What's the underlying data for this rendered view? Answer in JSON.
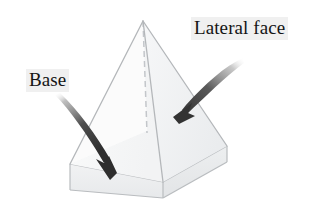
{
  "figure": {
    "shape_name": "square-pyramid-with-base-slab",
    "background_color": "#ffffff",
    "line_color": "#b9bcbf",
    "hidden_line_color": "#c9ccd0",
    "face_fill_light": "#f6f7f8",
    "face_fill_shaded": "#eceeef",
    "base_slab_fill": "#e6e8ea",
    "arrow_color": "#3b3b3b",
    "label_background": "#f0f0f0",
    "label_text_color": "#151515"
  },
  "labels": [
    {
      "id": "lateral-face",
      "text": "Lateral face",
      "x": 191,
      "y": 17
    },
    {
      "id": "base",
      "text": "Base",
      "x": 26,
      "y": 69
    }
  ],
  "annotations": {
    "lateral_face_arrow": {
      "name": "lateral-face-arrow",
      "tail_x": 242,
      "tail_y": 59,
      "tip_x": 174,
      "tip_y": 117,
      "points_to": "lateral face triangle"
    },
    "base_arrow": {
      "name": "base-arrow",
      "tail_x": 55,
      "tail_y": 96,
      "tip_x": 110,
      "tip_y": 179,
      "points_to": "base slab top face"
    }
  },
  "geometry": {
    "apex": {
      "x": 143,
      "y": 21
    },
    "base_top_left": {
      "x": 70,
      "y": 164
    },
    "base_top_front": {
      "x": 163,
      "y": 182
    },
    "base_top_right": {
      "x": 227,
      "y": 146
    },
    "base_top_back": {
      "x": 147,
      "y": 131
    },
    "base_bottom_left": {
      "x": 70,
      "y": 190
    },
    "base_bottom_front": {
      "x": 163,
      "y": 198
    },
    "base_bottom_right": {
      "x": 227,
      "y": 162
    }
  }
}
